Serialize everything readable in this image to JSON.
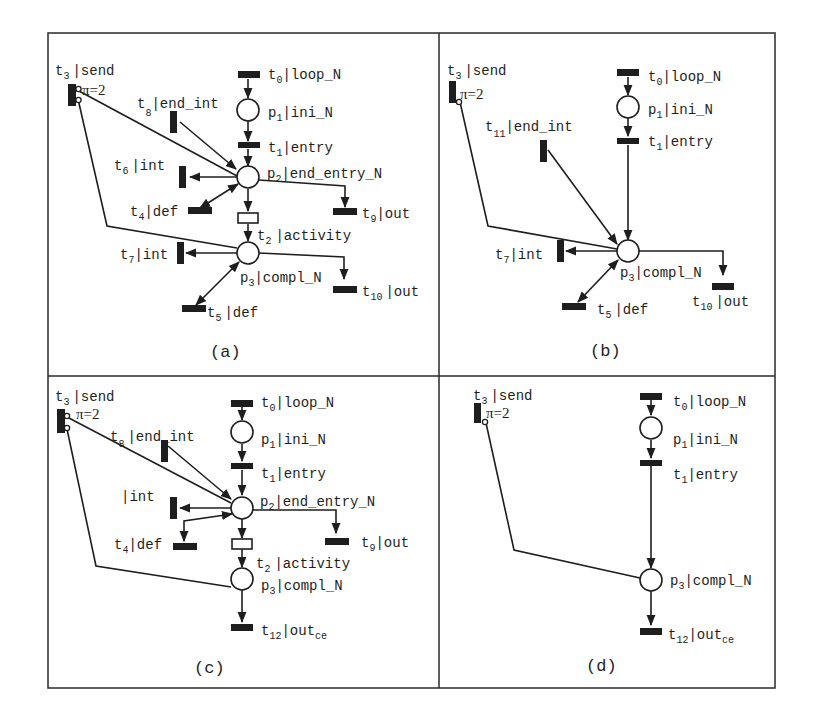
{
  "figure": {
    "layout": "2x2 grid of Petri net panels",
    "panels": [
      {
        "id": "a",
        "caption": "(a)",
        "labels": {
          "t3": {
            "name": "t",
            "sub": "3",
            "text": "|send"
          },
          "pi": "π=2",
          "t0": {
            "name": "t",
            "sub": "0",
            "text": "|loop_N"
          },
          "p1": {
            "name": "p",
            "sub": "1",
            "text": "|ini_N"
          },
          "t8": {
            "name": "t",
            "sub": "8",
            "text": "|end_int"
          },
          "t1": {
            "name": "t",
            "sub": "1",
            "text": "|entry"
          },
          "t6": {
            "name": "t",
            "sub": "6",
            "text": "|int"
          },
          "p2": {
            "name": "p",
            "sub": "2",
            "text": "|end_entry_N"
          },
          "t4": {
            "name": "t",
            "sub": "4",
            "text": "|def"
          },
          "t9": {
            "name": "t",
            "sub": "9",
            "text": "|out"
          },
          "t2": {
            "name": "t",
            "sub": "2",
            "text": "|activity"
          },
          "t7": {
            "name": "t",
            "sub": "7",
            "text": "|int"
          },
          "p3": {
            "name": "p",
            "sub": "3",
            "text": "|compl_N"
          },
          "t10": {
            "name": "t",
            "sub": "10",
            "text": "|out"
          },
          "t5": {
            "name": "t",
            "sub": "5",
            "text": "|def"
          }
        }
      },
      {
        "id": "b",
        "caption": "(b)",
        "labels": {
          "t3": {
            "name": "t",
            "sub": "3",
            "text": "|send"
          },
          "pi": "π=2",
          "t0": {
            "name": "t",
            "sub": "0",
            "text": "|loop_N"
          },
          "p1": {
            "name": "p",
            "sub": "1",
            "text": "|ini_N"
          },
          "t11": {
            "name": "t",
            "sub": "11",
            "text": "|end_int"
          },
          "t1": {
            "name": "t",
            "sub": "1",
            "text": "|entry"
          },
          "t7": {
            "name": "t",
            "sub": "7",
            "text": "|int"
          },
          "p3": {
            "name": "p",
            "sub": "3",
            "text": "|compl_N"
          },
          "t5": {
            "name": "t",
            "sub": "5",
            "text": "|def"
          },
          "t10": {
            "name": "t",
            "sub": "10",
            "text": "|out"
          }
        }
      },
      {
        "id": "c",
        "caption": "(c)",
        "labels": {
          "t3": {
            "name": "t",
            "sub": "3",
            "text": "|send"
          },
          "pi": "π=2",
          "t0": {
            "name": "t",
            "sub": "0",
            "text": "|loop_N"
          },
          "p1": {
            "name": "p",
            "sub": "1",
            "text": "|ini_N"
          },
          "t8": {
            "name": "t",
            "sub": "8",
            "text": "|end_int"
          },
          "t1": {
            "name": "t",
            "sub": "1",
            "text": "|entry"
          },
          "int": {
            "name": "",
            "sub": "",
            "text": "|int"
          },
          "p2": {
            "name": "p",
            "sub": "2",
            "text": "|end_entry_N"
          },
          "t4": {
            "name": "t",
            "sub": "4",
            "text": "|def"
          },
          "t9": {
            "name": "t",
            "sub": "9",
            "text": "|out"
          },
          "t2": {
            "name": "t",
            "sub": "2",
            "text": "|activity"
          },
          "p3": {
            "name": "p",
            "sub": "3",
            "text": "|compl_N"
          },
          "t12": {
            "name": "t",
            "sub": "12",
            "text": "|out",
            "suffix": "ce"
          }
        }
      },
      {
        "id": "d",
        "caption": "(d)",
        "labels": {
          "t3": {
            "name": "t",
            "sub": "3",
            "text": "|send"
          },
          "pi": "π=2",
          "t0": {
            "name": "t",
            "sub": "0",
            "text": "|loop_N"
          },
          "p1": {
            "name": "p",
            "sub": "1",
            "text": "|ini_N"
          },
          "t1": {
            "name": "t",
            "sub": "1",
            "text": "|entry"
          },
          "p3": {
            "name": "p",
            "sub": "3",
            "text": "|compl_N"
          },
          "t12": {
            "name": "t",
            "sub": "12",
            "text": "|out",
            "suffix": "ce"
          }
        }
      }
    ]
  }
}
